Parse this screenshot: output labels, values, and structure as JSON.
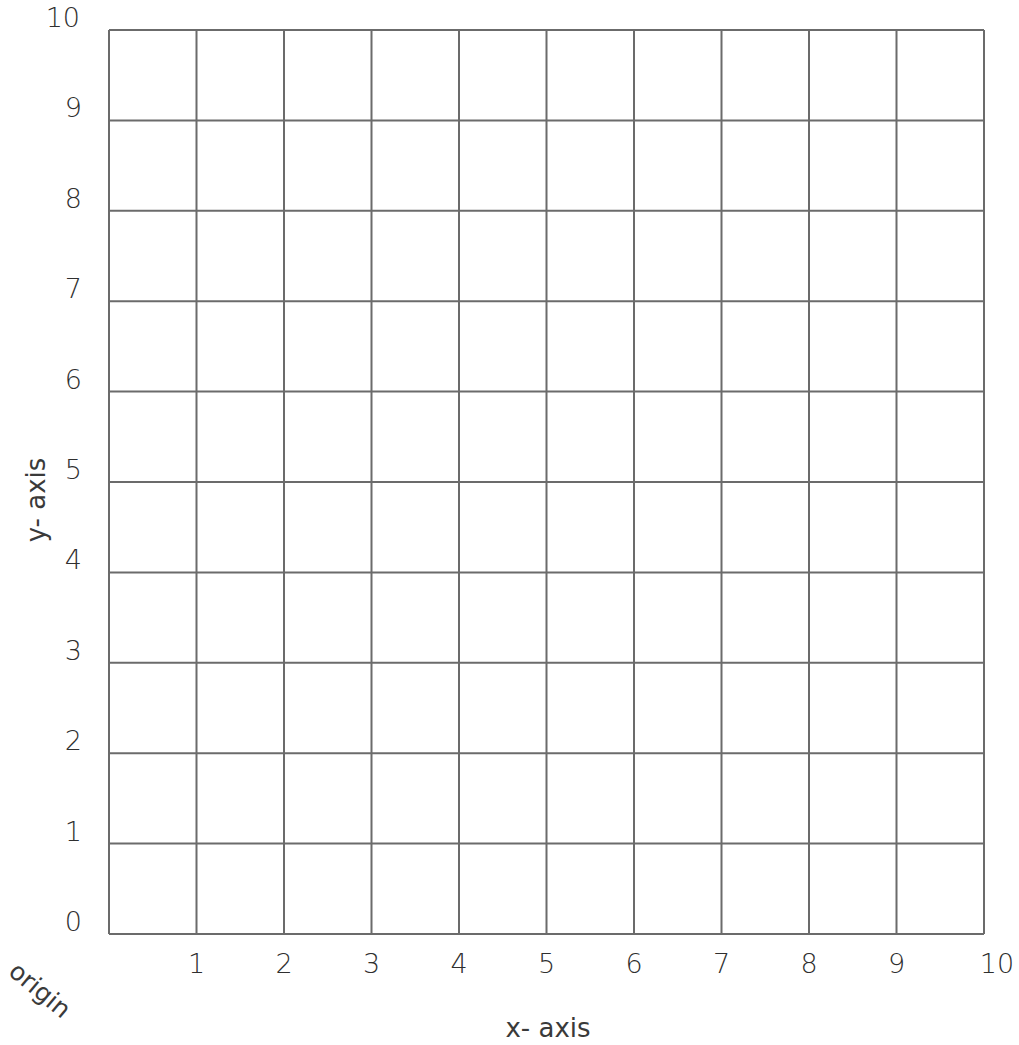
{
  "chart_data": {
    "type": "grid",
    "title": "",
    "xlabel": "x- axis",
    "ylabel": "y- axis",
    "origin_label": "origin",
    "xlim": [
      0,
      10
    ],
    "ylim": [
      0,
      10
    ],
    "x_ticks": [
      "1",
      "2",
      "3",
      "4",
      "5",
      "6",
      "7",
      "8",
      "9",
      "10"
    ],
    "y_ticks": [
      "0",
      "1",
      "2",
      "3",
      "4",
      "5",
      "6",
      "7",
      "8",
      "9",
      "10"
    ],
    "grid": true,
    "series": []
  },
  "style": {
    "grid_color": "#6b6b6b",
    "text_color": "#2f2f2f"
  }
}
